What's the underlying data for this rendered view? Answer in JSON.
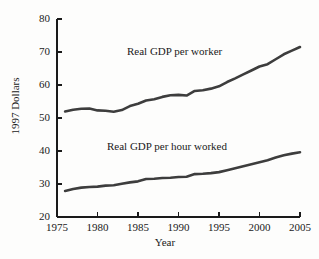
{
  "chart_data": {
    "type": "line",
    "title": "",
    "xlabel": "Year",
    "ylabel": "1997 Dollars",
    "xlim": [
      1975,
      2005
    ],
    "ylim": [
      20,
      80
    ],
    "grid": false,
    "legend_position": "inline-annotation",
    "xticks": [
      1975,
      1980,
      1985,
      1990,
      1995,
      2000,
      2005
    ],
    "yticks": [
      20,
      30,
      40,
      50,
      60,
      70,
      80
    ],
    "x": [
      1976,
      1977,
      1978,
      1979,
      1980,
      1981,
      1982,
      1983,
      1984,
      1985,
      1986,
      1987,
      1988,
      1989,
      1990,
      1991,
      1992,
      1993,
      1994,
      1995,
      1996,
      1997,
      1998,
      1999,
      2000,
      2001,
      2002,
      2003,
      2004,
      2005
    ],
    "series": [
      {
        "name": "Real GDP per worker",
        "color": "#3d3d3d",
        "values": [
          52.0,
          52.5,
          52.8,
          52.9,
          52.3,
          52.2,
          51.9,
          52.4,
          53.6,
          54.3,
          55.3,
          55.7,
          56.4,
          56.9,
          57.0,
          56.8,
          58.2,
          58.4,
          58.9,
          59.6,
          60.9,
          62.0,
          63.2,
          64.4,
          65.6,
          66.3,
          67.8,
          69.3,
          70.4,
          71.5
        ]
      },
      {
        "name": "Real GDP per hour worked",
        "color": "#3d3d3d",
        "values": [
          27.9,
          28.5,
          28.9,
          29.1,
          29.2,
          29.5,
          29.6,
          30.1,
          30.5,
          30.8,
          31.5,
          31.6,
          31.8,
          31.9,
          32.1,
          32.2,
          33.0,
          33.1,
          33.3,
          33.6,
          34.2,
          34.8,
          35.4,
          36.0,
          36.6,
          37.2,
          38.0,
          38.7,
          39.2,
          39.6
        ]
      }
    ]
  },
  "axis_titles": {
    "x": "Year",
    "y": "1997 Dollars"
  },
  "annotations": {
    "upper_series_label": "Real GDP per worker",
    "lower_series_label": "Real GDP per hour worked"
  }
}
